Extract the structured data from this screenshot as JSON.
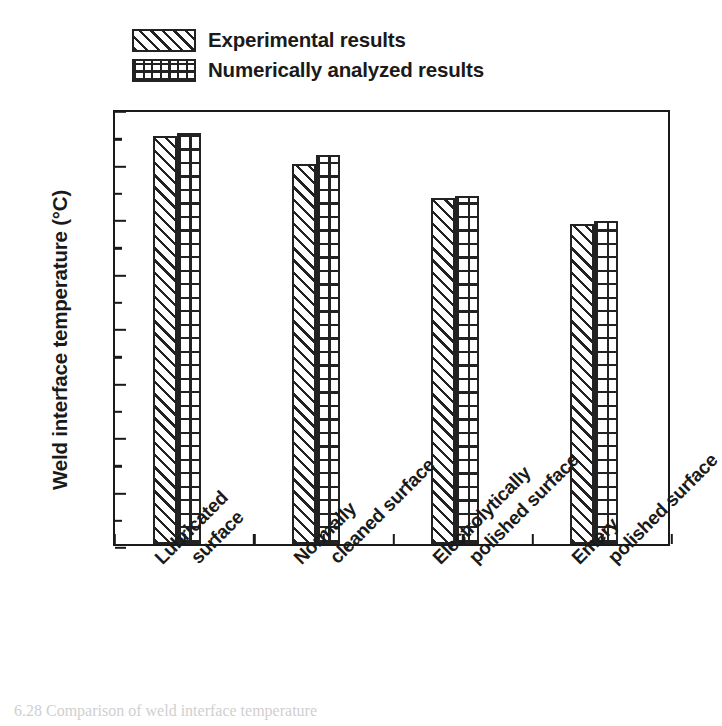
{
  "chart_data": {
    "type": "bar",
    "title": "",
    "xlabel": "",
    "ylabel": "Weld interface temperature (°C)",
    "ylim": [
      0,
      400
    ],
    "ytick_step": 50,
    "yticks": [
      0,
      50,
      100,
      150,
      200,
      250,
      300,
      350,
      400
    ],
    "ytick_labels": [
      "0",
      "50",
      "100",
      "150",
      "200",
      "250",
      "300",
      "350",
      "400"
    ],
    "minor_ticks": true,
    "grid": false,
    "legend_position": "above-plot-left",
    "categories": [
      "Lubricated surface",
      "Normally cleaned surface",
      "Electrolytically polished surface",
      "Emery polished surface"
    ],
    "category_lines": [
      [
        "Lubricated",
        "surface"
      ],
      [
        "Normally",
        "cleaned surface"
      ],
      [
        "Electrolytically",
        "polished surface"
      ],
      [
        "Emery",
        "polished surface"
      ]
    ],
    "series": [
      {
        "name": "Experimental results",
        "pattern": "diagonal-hatch",
        "values": [
          374,
          349,
          317,
          294
        ]
      },
      {
        "name": "Numerically analyzed results",
        "pattern": "cross-hatch",
        "values": [
          377,
          357,
          319,
          296
        ]
      }
    ]
  },
  "legend": {
    "items": [
      {
        "label": "Experimental results"
      },
      {
        "label": "Numerically analyzed results"
      }
    ]
  },
  "caption": {
    "text": "6.28  Comparison of weld interface temperature"
  },
  "colors": {
    "ink": "#1a1a1a",
    "hatch": "#222222",
    "background": "#ffffff"
  }
}
